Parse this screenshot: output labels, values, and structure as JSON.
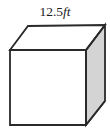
{
  "figure": {
    "type": "solid-geometry-cube",
    "shape_name": "cube",
    "label": {
      "full_text": "12.5ft",
      "value": "12.5",
      "unit": "ft",
      "position": "top"
    },
    "colors": {
      "stroke": "#2a2a2a",
      "front_face_fill": "#ffffff",
      "top_face_fill": "#ffffff",
      "right_face_fill": "#d4d4d4",
      "background": "#ffffff",
      "text": "#1d1d1d"
    },
    "geometry": {
      "stroke_width": 1.8,
      "front_face_points": "10,50 86,50 86,125 10,125",
      "top_face_points": "10,50 28,26 105,25 86,50",
      "right_face_points": "86,50 105,25 105,101 86,125",
      "label_x": 55,
      "label_y": 16
    }
  }
}
